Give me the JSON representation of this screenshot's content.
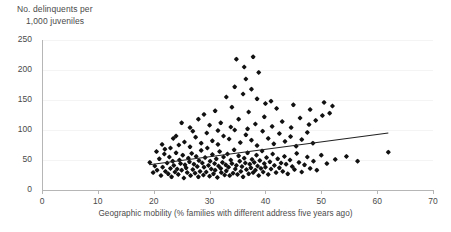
{
  "chart_data": {
    "type": "scatter",
    "title": "",
    "ylabel": "No. delinquents per 1,000 juveniles",
    "ylabel_line1": "No. delinquents per",
    "ylabel_line2": "1,000 juveniles",
    "xlabel": "Geographic mobility (% families with different address five years ago)",
    "xlim": [
      0,
      70
    ],
    "ylim": [
      0,
      250
    ],
    "xticks": [
      0,
      10,
      20,
      30,
      40,
      50,
      60,
      70
    ],
    "yticks": [
      0,
      50,
      100,
      150,
      200,
      250
    ],
    "grid": "horizontal-faint",
    "legend": "none",
    "marker_color": "#111111",
    "trendline": {
      "visible": true,
      "color": "#222222",
      "x_start": 19.2,
      "y_start": 42.0,
      "x_end": 62.0,
      "y_end": 95.0
    },
    "points": [
      [
        19.3,
        46.0
      ],
      [
        19.9,
        29.0
      ],
      [
        20.2,
        40.0
      ],
      [
        20.6,
        33.0
      ],
      [
        21.0,
        52.0
      ],
      [
        21.3,
        24.0
      ],
      [
        21.6,
        38.0
      ],
      [
        21.9,
        60.0
      ],
      [
        22.1,
        31.0
      ],
      [
        22.4,
        45.0
      ],
      [
        22.6,
        27.0
      ],
      [
        22.8,
        55.0
      ],
      [
        23.0,
        36.0
      ],
      [
        23.2,
        22.0
      ],
      [
        23.4,
        48.0
      ],
      [
        23.6,
        41.0
      ],
      [
        23.8,
        30.0
      ],
      [
        24.0,
        62.0
      ],
      [
        24.2,
        35.0
      ],
      [
        24.4,
        26.0
      ],
      [
        24.6,
        50.0
      ],
      [
        24.8,
        44.0
      ],
      [
        25.0,
        33.0
      ],
      [
        25.2,
        58.0
      ],
      [
        25.4,
        20.0
      ],
      [
        25.6,
        42.0
      ],
      [
        25.8,
        37.0
      ],
      [
        26.0,
        29.0
      ],
      [
        26.2,
        53.0
      ],
      [
        26.4,
        47.0
      ],
      [
        26.6,
        24.0
      ],
      [
        26.8,
        61.0
      ],
      [
        27.0,
        34.0
      ],
      [
        27.2,
        43.0
      ],
      [
        27.4,
        28.0
      ],
      [
        27.6,
        56.0
      ],
      [
        27.8,
        39.0
      ],
      [
        28.0,
        22.0
      ],
      [
        28.1,
        49.0
      ],
      [
        28.3,
        31.0
      ],
      [
        28.5,
        66.0
      ],
      [
        28.7,
        45.0
      ],
      [
        28.9,
        25.0
      ],
      [
        29.0,
        38.0
      ],
      [
        29.2,
        54.0
      ],
      [
        29.4,
        30.0
      ],
      [
        29.6,
        70.0
      ],
      [
        29.8,
        41.0
      ],
      [
        30.0,
        23.0
      ],
      [
        30.1,
        48.0
      ],
      [
        30.3,
        35.0
      ],
      [
        30.5,
        59.0
      ],
      [
        30.7,
        27.0
      ],
      [
        30.9,
        44.0
      ],
      [
        31.0,
        33.0
      ],
      [
        31.2,
        52.0
      ],
      [
        31.4,
        21.0
      ],
      [
        31.6,
        40.0
      ],
      [
        31.8,
        64.0
      ],
      [
        32.0,
        36.0
      ],
      [
        32.1,
        29.0
      ],
      [
        32.3,
        46.0
      ],
      [
        32.5,
        55.0
      ],
      [
        32.7,
        25.0
      ],
      [
        32.9,
        42.0
      ],
      [
        33.0,
        32.0
      ],
      [
        33.2,
        60.0
      ],
      [
        33.4,
        38.0
      ],
      [
        33.6,
        24.0
      ],
      [
        33.8,
        50.0
      ],
      [
        34.0,
        44.0
      ],
      [
        34.2,
        28.0
      ],
      [
        34.4,
        67.0
      ],
      [
        34.6,
        35.0
      ],
      [
        34.8,
        41.0
      ],
      [
        35.0,
        26.0
      ],
      [
        35.2,
        57.0
      ],
      [
        35.4,
        48.0
      ],
      [
        35.6,
        31.0
      ],
      [
        35.8,
        39.0
      ],
      [
        36.0,
        22.0
      ],
      [
        36.2,
        53.0
      ],
      [
        36.4,
        45.0
      ],
      [
        36.6,
        34.0
      ],
      [
        36.8,
        62.0
      ],
      [
        37.0,
        27.0
      ],
      [
        37.2,
        43.0
      ],
      [
        37.4,
        37.0
      ],
      [
        37.6,
        51.0
      ],
      [
        37.8,
        29.0
      ],
      [
        38.0,
        46.0
      ],
      [
        38.2,
        33.0
      ],
      [
        38.4,
        58.0
      ],
      [
        38.6,
        40.0
      ],
      [
        38.8,
        24.0
      ],
      [
        39.0,
        49.0
      ],
      [
        39.2,
        36.0
      ],
      [
        39.4,
        65.0
      ],
      [
        39.6,
        30.0
      ],
      [
        39.8,
        44.0
      ],
      [
        40.0,
        38.0
      ],
      [
        40.2,
        54.0
      ],
      [
        40.5,
        26.0
      ],
      [
        40.8,
        47.0
      ],
      [
        41.0,
        35.0
      ],
      [
        41.3,
        60.0
      ],
      [
        41.6,
        41.0
      ],
      [
        41.9,
        29.0
      ],
      [
        42.2,
        52.0
      ],
      [
        42.5,
        37.0
      ],
      [
        42.8,
        45.0
      ],
      [
        43.1,
        31.0
      ],
      [
        43.4,
        56.0
      ],
      [
        43.7,
        43.0
      ],
      [
        44.0,
        27.0
      ],
      [
        44.4,
        50.0
      ],
      [
        44.8,
        39.0
      ],
      [
        45.2,
        34.0
      ],
      [
        45.6,
        61.0
      ],
      [
        46.0,
        46.0
      ],
      [
        46.5,
        30.0
      ],
      [
        47.0,
        42.0
      ],
      [
        47.5,
        55.0
      ],
      [
        48.0,
        36.0
      ],
      [
        48.6,
        48.0
      ],
      [
        49.2,
        33.0
      ],
      [
        50.0,
        58.0
      ],
      [
        51.0,
        44.0
      ],
      [
        52.5,
        51.0
      ],
      [
        54.5,
        56.0
      ],
      [
        56.5,
        48.0
      ],
      [
        62.0,
        63.0
      ],
      [
        24.5,
        75.0
      ],
      [
        25.5,
        80.0
      ],
      [
        26.5,
        72.0
      ],
      [
        27.5,
        88.0
      ],
      [
        28.5,
        78.0
      ],
      [
        29.5,
        95.0
      ],
      [
        30.5,
        82.0
      ],
      [
        31.5,
        76.0
      ],
      [
        32.5,
        90.0
      ],
      [
        33.5,
        85.0
      ],
      [
        34.5,
        100.0
      ],
      [
        35.5,
        79.0
      ],
      [
        36.5,
        92.0
      ],
      [
        37.5,
        83.0
      ],
      [
        38.5,
        74.0
      ],
      [
        39.5,
        98.0
      ],
      [
        40.5,
        86.0
      ],
      [
        41.5,
        77.0
      ],
      [
        42.5,
        94.0
      ],
      [
        43.5,
        81.0
      ],
      [
        44.5,
        89.0
      ],
      [
        45.5,
        73.0
      ],
      [
        46.5,
        84.0
      ],
      [
        47.5,
        96.0
      ],
      [
        48.5,
        78.0
      ],
      [
        23.0,
        70.0
      ],
      [
        22.0,
        68.0
      ],
      [
        21.5,
        76.0
      ],
      [
        20.5,
        64.0
      ],
      [
        30.0,
        108.0
      ],
      [
        32.0,
        112.0
      ],
      [
        33.8,
        105.0
      ],
      [
        35.2,
        118.0
      ],
      [
        36.8,
        102.0
      ],
      [
        38.2,
        110.0
      ],
      [
        39.8,
        122.0
      ],
      [
        41.2,
        106.0
      ],
      [
        43.0,
        114.0
      ],
      [
        44.6,
        104.0
      ],
      [
        46.2,
        120.0
      ],
      [
        47.8,
        109.0
      ],
      [
        49.0,
        116.0
      ],
      [
        50.2,
        124.0
      ],
      [
        51.5,
        128.0
      ],
      [
        31.0,
        132.0
      ],
      [
        34.0,
        138.0
      ],
      [
        37.0,
        130.0
      ],
      [
        40.0,
        144.0
      ],
      [
        42.0,
        136.0
      ],
      [
        45.0,
        142.0
      ],
      [
        48.0,
        134.0
      ],
      [
        50.5,
        146.0
      ],
      [
        52.0,
        140.0
      ],
      [
        33.0,
        155.0
      ],
      [
        36.0,
        160.0
      ],
      [
        38.5,
        152.0
      ],
      [
        41.0,
        148.0
      ],
      [
        34.5,
        172.0
      ],
      [
        37.5,
        168.0
      ],
      [
        36.5,
        185.0
      ],
      [
        38.8,
        196.0
      ],
      [
        34.8,
        218.0
      ],
      [
        37.8,
        222.0
      ],
      [
        36.2,
        205.0
      ],
      [
        28.0,
        118.0
      ],
      [
        26.5,
        104.0
      ],
      [
        25.0,
        112.0
      ],
      [
        27.0,
        98.0
      ],
      [
        29.0,
        126.0
      ],
      [
        31.5,
        99.0
      ],
      [
        24.0,
        90.0
      ],
      [
        23.5,
        86.0
      ]
    ]
  }
}
